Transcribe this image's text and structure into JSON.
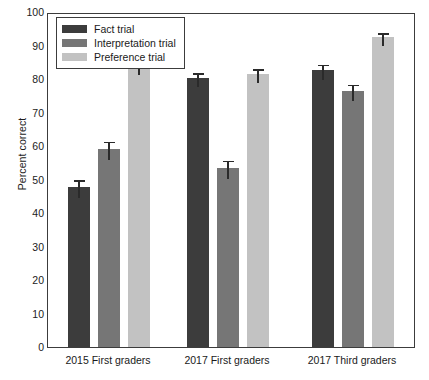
{
  "chart_data": {
    "type": "bar",
    "title": "",
    "xlabel": "",
    "ylabel": "Percent correct",
    "ylim": [
      0,
      100
    ],
    "ytick_values": [
      0,
      10,
      20,
      30,
      40,
      50,
      60,
      70,
      80,
      90,
      100
    ],
    "ytick_labels": [
      "0",
      "10",
      "20",
      "30",
      "40",
      "50",
      "60",
      "70",
      "80",
      "90",
      "100"
    ],
    "grid": false,
    "legend_position": "upper left",
    "categories": [
      "2015 First graders",
      "2017 First graders",
      "2017 Third graders"
    ],
    "series": [
      {
        "name": "Fact trial",
        "color": "#3c3c3c",
        "values": [
          47.8,
          80.3,
          82.6
        ],
        "errors": [
          2.6,
          2.0,
          2.3
        ]
      },
      {
        "name": "Interpretation trial",
        "color": "#767676",
        "values": [
          59.1,
          53.5,
          76.4
        ],
        "errors": [
          2.8,
          2.7,
          2.5
        ]
      },
      {
        "name": "Preference trial",
        "color": "#c2c2c2",
        "values": [
          84.0,
          81.5,
          92.4
        ],
        "errors": [
          2.2,
          2.0,
          1.9
        ]
      }
    ]
  },
  "legend": {
    "entries": [
      {
        "label": "Fact trial"
      },
      {
        "label": "Interpretation trial"
      },
      {
        "label": "Preference trial"
      }
    ]
  },
  "axis": {
    "y_title": "Percent correct"
  }
}
